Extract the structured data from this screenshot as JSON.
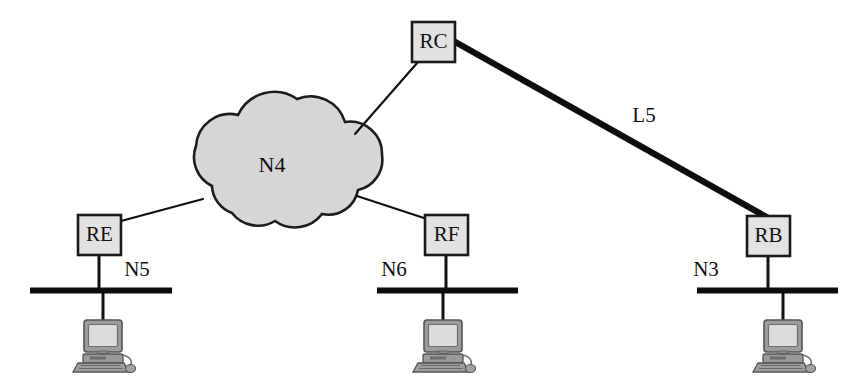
{
  "diagram": {
    "canvas": {
      "width": 862,
      "height": 384,
      "background": "#ffffff"
    },
    "colors": {
      "line": "#101010",
      "thick_link": "#0d0d0d",
      "bus": "#0d0d0d",
      "router_fill": "#e2e2e2",
      "router_border": "#1a1a1a",
      "cloud_fill": "#d6d6d6",
      "cloud_border": "#1c1c1c",
      "text": "#101010",
      "monitor_screen": "#d8d8d8",
      "monitor_case": "#8a8a8a",
      "monitor_body": "#9a9a9a"
    },
    "cloud": {
      "name": "cloud-n4",
      "label": "N4",
      "label_x": 272,
      "label_y": 167,
      "fill": "#d6d6d6",
      "border": "#1c1c1c"
    },
    "routers": [
      {
        "name": "router-rc",
        "label": "RC",
        "x": 412,
        "y": 22,
        "w": 43,
        "h": 40
      },
      {
        "name": "router-re",
        "label": "RE",
        "x": 78,
        "y": 215,
        "w": 43,
        "h": 40
      },
      {
        "name": "router-rf",
        "label": "RF",
        "x": 425,
        "y": 215,
        "w": 43,
        "h": 40
      },
      {
        "name": "router-rb",
        "label": "RB",
        "x": 747,
        "y": 216,
        "w": 43,
        "h": 40
      }
    ],
    "networks": [
      {
        "name": "bus-n5",
        "label": "N5",
        "x1": 30,
        "x2": 172,
        "y": 290,
        "label_x": 137,
        "label_y": 271
      },
      {
        "name": "bus-n6",
        "label": "N6",
        "x1": 377,
        "x2": 518,
        "y": 290,
        "label_x": 394,
        "label_y": 271
      },
      {
        "name": "bus-n3",
        "label": "N3",
        "x1": 697,
        "x2": 838,
        "y": 290,
        "label_x": 706,
        "label_y": 271
      }
    ],
    "links": [
      {
        "name": "link-l5",
        "label": "L5",
        "from": "RC",
        "to": "RB",
        "style": "thick",
        "x1": 450,
        "y1": 40,
        "x2": 770,
        "y2": 218,
        "width": 6,
        "label_x": 644,
        "label_y": 117
      },
      {
        "name": "link-rc-cloud",
        "label": "",
        "from": "RC",
        "to": "N4",
        "style": "thin",
        "x1": 418,
        "y1": 62,
        "x2": 355,
        "y2": 134,
        "width": 2
      },
      {
        "name": "link-re-cloud",
        "label": "",
        "from": "RE",
        "to": "N4",
        "style": "thin",
        "x1": 121,
        "y1": 221,
        "x2": 203,
        "y2": 199,
        "width": 2
      },
      {
        "name": "link-rf-cloud",
        "label": "",
        "from": "RF",
        "to": "N4",
        "style": "thin",
        "x1": 427,
        "y1": 219,
        "x2": 357,
        "y2": 196,
        "width": 2
      }
    ],
    "drops": [
      {
        "name": "drop-re-n5",
        "x": 99,
        "y1": 255,
        "y2": 290,
        "width": 3
      },
      {
        "name": "drop-rf-n6",
        "x": 446,
        "y1": 255,
        "y2": 290,
        "width": 3
      },
      {
        "name": "drop-rb-n3",
        "x": 768,
        "y1": 256,
        "y2": 290,
        "width": 3
      },
      {
        "name": "drop-n5-host",
        "x": 103,
        "y1": 292,
        "y2": 322,
        "width": 3
      },
      {
        "name": "drop-n6-host",
        "x": 443,
        "y1": 292,
        "y2": 322,
        "width": 3
      },
      {
        "name": "drop-n3-host",
        "x": 783,
        "y1": 292,
        "y2": 322,
        "width": 3
      }
    ],
    "workstations": [
      {
        "name": "workstation-n5",
        "cx": 103,
        "cy": 322
      },
      {
        "name": "workstation-n6",
        "cx": 443,
        "cy": 322
      },
      {
        "name": "workstation-n3",
        "cx": 783,
        "cy": 322
      }
    ]
  }
}
